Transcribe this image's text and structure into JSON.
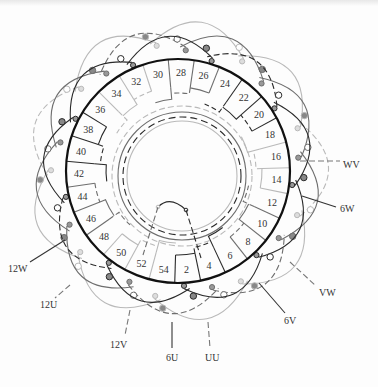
{
  "figure": {
    "type": "stator-winding-diagram",
    "slot_labels": [
      "2",
      "4",
      "6",
      "8",
      "10",
      "12",
      "14",
      "16",
      "18",
      "20",
      "22",
      "24",
      "26",
      "28",
      "30",
      "32",
      "34",
      "36",
      "38",
      "40",
      "42",
      "44",
      "46",
      "48",
      "50",
      "52",
      "54"
    ],
    "terminal_labels": [
      {
        "id": "WV",
        "text": "WV",
        "x": 343,
        "y": 168,
        "line": [
          300,
          161,
          340,
          161
        ],
        "dash": true
      },
      {
        "id": "6W",
        "text": "6W",
        "x": 340,
        "y": 212,
        "line": [
          302,
          196,
          336,
          207
        ],
        "dash": false
      },
      {
        "id": "VW",
        "text": "VW",
        "x": 319,
        "y": 296,
        "line": [
          290,
          262,
          316,
          286
        ],
        "dash": true
      },
      {
        "id": "6V",
        "text": "6V",
        "x": 284,
        "y": 324,
        "line": [
          259,
          283,
          285,
          313
        ],
        "dash": false
      },
      {
        "id": "UU",
        "text": "UU",
        "x": 205,
        "y": 361,
        "line": [
          208,
          322,
          210,
          348
        ],
        "dash": true
      },
      {
        "id": "6U",
        "text": "6U",
        "x": 166,
        "y": 361,
        "line": [
          172,
          322,
          172,
          348
        ],
        "dash": false
      },
      {
        "id": "12V",
        "text": "12V",
        "x": 110,
        "y": 348,
        "line": [
          130,
          310,
          125,
          335
        ],
        "dash": true
      },
      {
        "id": "12U",
        "text": "12U",
        "x": 40,
        "y": 308,
        "line": [
          70,
          285,
          55,
          298
        ],
        "dash": true
      },
      {
        "id": "12W",
        "text": "12W",
        "x": 8,
        "y": 272,
        "line": [
          65,
          240,
          30,
          262
        ],
        "dash": false
      }
    ],
    "colors": {
      "phase_a": "#2a2a2a",
      "phase_b": "#6e6e6e",
      "phase_c": "#b9b9b9",
      "stator_ring": "#111111",
      "background": "#fdfdfd"
    }
  }
}
